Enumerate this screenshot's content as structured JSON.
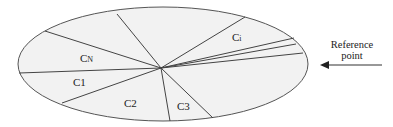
{
  "diagram": {
    "ellipse": {
      "cx": 163,
      "cy": 64,
      "rx": 145,
      "ry": 57,
      "fill": "#f2f2f2",
      "stroke": "#555555"
    },
    "center": {
      "x": 161,
      "y": 68
    },
    "spokes": [
      {
        "x": 117,
        "y": 14
      },
      {
        "x": 45,
        "y": 31
      },
      {
        "x": 19,
        "y": 73
      },
      {
        "x": 62,
        "y": 103
      },
      {
        "x": 170,
        "y": 121
      },
      {
        "x": 213,
        "y": 118
      },
      {
        "x": 303,
        "y": 53
      },
      {
        "x": 296,
        "y": 44
      },
      {
        "x": 294,
        "y": 38
      },
      {
        "x": 245,
        "y": 17
      }
    ],
    "sectors": [
      {
        "label": "CN",
        "main": "C",
        "sub": "N",
        "x": 80,
        "y": 62
      },
      {
        "label": "C1",
        "main": "C1",
        "sub": "",
        "x": 73,
        "y": 86
      },
      {
        "label": "C2",
        "main": "C2",
        "sub": "",
        "x": 124,
        "y": 107
      },
      {
        "label": "C3",
        "main": "C3",
        "sub": "",
        "x": 177,
        "y": 110
      },
      {
        "label": "Ci",
        "main": "C",
        "sub": "i",
        "x": 232,
        "y": 41
      }
    ],
    "reference": {
      "line1": "Reference",
      "line2": "point",
      "arrow": {
        "x1": 382,
        "y1": 65,
        "x2": 320,
        "y2": 65
      }
    }
  }
}
